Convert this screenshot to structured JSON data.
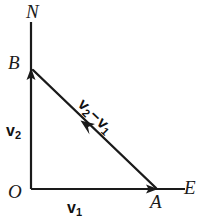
{
  "figure": {
    "type": "vector-diagram",
    "background_color": "#ffffff",
    "stroke_color": "#1a1a1a",
    "width": 203,
    "height": 222
  },
  "axes": {
    "vertical": {
      "label": "N",
      "direction": "north",
      "x": 31,
      "y_top": 22,
      "y_bottom": 189
    },
    "horizontal": {
      "label": "E",
      "direction": "east",
      "y": 189,
      "x_left": 31,
      "x_right": 185
    }
  },
  "points": [
    {
      "name": "origin",
      "label": "O",
      "x": 31,
      "y": 189
    },
    {
      "name": "point-b",
      "label": "B",
      "x": 31,
      "y": 68
    },
    {
      "name": "point-a",
      "label": "A",
      "x": 158,
      "y": 189
    },
    {
      "name": "north-marker",
      "label": "N",
      "x": 31,
      "y": 22
    },
    {
      "name": "east-marker",
      "label": "E",
      "x": 185,
      "y": 189
    }
  ],
  "vectors": [
    {
      "name": "v1",
      "symbol": "v",
      "subscript": "1",
      "from": "O",
      "to": "A",
      "x1": 31,
      "y1": 189,
      "x2": 158,
      "y2": 189,
      "label_x": 67,
      "label_y": 200
    },
    {
      "name": "v2",
      "symbol": "v",
      "subscript": "2",
      "from": "O",
      "to": "B",
      "x1": 31,
      "y1": 189,
      "x2": 31,
      "y2": 68,
      "label_x": 6,
      "label_y": 123
    },
    {
      "name": "v2-minus-v1",
      "symbol_first": "v",
      "subscript_first": "2",
      "operator": "−",
      "symbol_second": "v",
      "subscript_second": "1",
      "from": "A",
      "to": "B",
      "x1": 156,
      "y1": 188,
      "x2": 33,
      "y2": 70,
      "arrow_mid_x": 83,
      "arrow_mid_y": 123,
      "label_x": 86,
      "label_y": 96,
      "label_rotation_deg": 44
    }
  ]
}
